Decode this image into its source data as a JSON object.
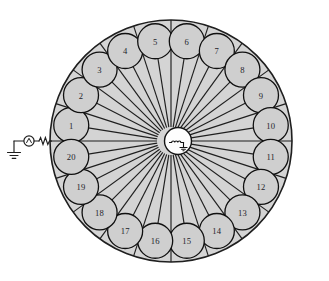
{
  "figure": {
    "type": "circuit-diagram",
    "background_color": "#ffffff",
    "sector_fill_color": "#d4d4d4",
    "sector_stroke_color": "#1f1f1f",
    "node_fill_color": "#cfcfcf",
    "node_stroke_color": "#101010",
    "hub_fill_color": "#fdfdfd",
    "label_color": "#23232a",
    "top_cropped_text": " "
  },
  "outer_circle": {
    "center_x": 171,
    "center_y": 141,
    "radius": 121,
    "stroke_width": 1.6
  },
  "hub": {
    "name": "central-source-hub",
    "center_x": 178,
    "center_y": 141,
    "radius": 13.5,
    "symbol": "inductor-coil-symbol"
  },
  "spokes": {
    "count": 20,
    "description": "radial feeders from the central hub to each load node"
  },
  "nodes": [
    {
      "id": 1,
      "label": "1",
      "angle_deg": 189
    },
    {
      "id": 2,
      "label": "2",
      "angle_deg": 207
    },
    {
      "id": 3,
      "label": "3",
      "angle_deg": 225
    },
    {
      "id": 4,
      "label": "4",
      "angle_deg": 243
    },
    {
      "id": 5,
      "label": "5",
      "angle_deg": 261
    },
    {
      "id": 6,
      "label": "6",
      "angle_deg": 279
    },
    {
      "id": 7,
      "label": "7",
      "angle_deg": 297
    },
    {
      "id": 8,
      "label": "8",
      "angle_deg": 315
    },
    {
      "id": 9,
      "label": "9",
      "angle_deg": 333
    },
    {
      "id": 10,
      "label": "10",
      "angle_deg": 351
    },
    {
      "id": 11,
      "label": "11",
      "angle_deg": 9
    },
    {
      "id": 12,
      "label": "12",
      "angle_deg": 27
    },
    {
      "id": 13,
      "label": "13",
      "angle_deg": 45
    },
    {
      "id": 14,
      "label": "14",
      "angle_deg": 63
    },
    {
      "id": 15,
      "label": "15",
      "angle_deg": 81
    },
    {
      "id": 16,
      "label": "16",
      "angle_deg": 99
    },
    {
      "id": 17,
      "label": "17",
      "angle_deg": 117
    },
    {
      "id": 18,
      "label": "18",
      "angle_deg": 135
    },
    {
      "id": 19,
      "label": "19",
      "angle_deg": 153
    },
    {
      "id": 20,
      "label": "20",
      "angle_deg": 171
    }
  ],
  "node_geometry": {
    "orbit_radius": 101,
    "node_radius": 17.5,
    "stroke_width": 1.3
  },
  "source_branch": {
    "name": "supply-branch",
    "ground_symbol": {
      "name": "ground-symbol",
      "x": 14,
      "y": 152
    },
    "source_symbol": {
      "name": "ac-voltage-source-symbol",
      "cx": 29,
      "cy": 140,
      "r": 5
    },
    "resistor_symbol": {
      "name": "series-resistor-symbol",
      "x1": 40,
      "y1": 141,
      "x2": 50,
      "y2": 141
    },
    "feed_point_x": 51,
    "feed_point_y": 141
  }
}
